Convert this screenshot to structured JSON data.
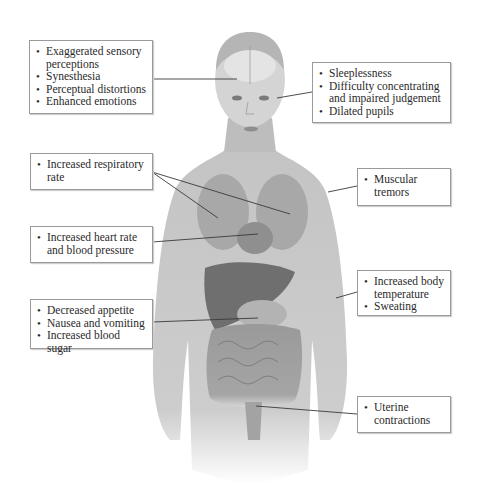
{
  "diagram": {
    "colors": {
      "skin": "#c9c9c9",
      "organs": "#8a8a8a",
      "box_border": "#9a9a9a",
      "leader_line": "#3a3a3a"
    },
    "callouts": [
      {
        "id": "brain",
        "side": "left",
        "target": "brain",
        "items": [
          "Exaggerated sensory perceptions",
          "Synesthesia",
          "Perceptual distortions",
          "Enhanced emotions"
        ]
      },
      {
        "id": "eyes",
        "side": "right",
        "target": "eyes",
        "items": [
          "Sleeplessness",
          "Difficulty concentrating and impaired judgement",
          "Dilated pupils"
        ]
      },
      {
        "id": "lungs",
        "side": "left",
        "target": "lungs",
        "items": [
          "Increased respiratory rate"
        ]
      },
      {
        "id": "muscles",
        "side": "right",
        "target": "shoulder muscle",
        "items": [
          "Muscular tremors"
        ]
      },
      {
        "id": "heart",
        "side": "left",
        "target": "heart",
        "items": [
          "Increased heart rate and blood pressure"
        ]
      },
      {
        "id": "skin",
        "side": "right",
        "target": "arm skin",
        "items": [
          "Increased body temperature",
          "Sweating"
        ]
      },
      {
        "id": "stomach",
        "side": "left",
        "target": "stomach",
        "items": [
          "Decreased appetite",
          "Nausea and vomiting",
          "Increased blood sugar"
        ]
      },
      {
        "id": "uterus",
        "side": "right",
        "target": "uterus",
        "items": [
          "Uterine contractions"
        ]
      }
    ]
  }
}
